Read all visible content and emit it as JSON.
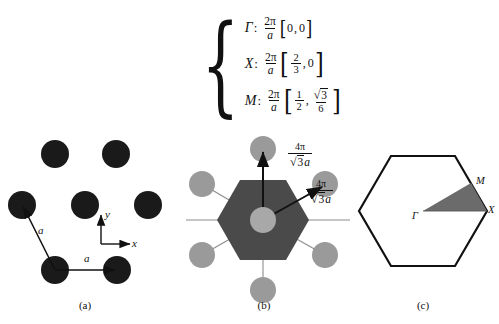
{
  "figure": {
    "background_color": "#ffffff"
  },
  "symmetry_points": {
    "brace_glyph": "{",
    "rows": [
      {
        "symbol": "Γ",
        "colon": ":",
        "prefactor_num": "2π",
        "prefactor_den": "a",
        "open": "[",
        "x": "0",
        "comma": ",",
        "y": "0",
        "close": "]"
      },
      {
        "symbol": "X",
        "colon": ":",
        "prefactor_num": "2π",
        "prefactor_den": "a",
        "open": "[",
        "x_num": "2",
        "x_den": "3",
        "comma": ",",
        "y": "0",
        "close": "]"
      },
      {
        "symbol": "M",
        "colon": ":",
        "prefactor_num": "2π",
        "prefactor_den": "a",
        "open": "[",
        "x_num": "1",
        "x_den": "2",
        "comma": ",",
        "y_num_radical": "√",
        "y_num_radicand": "3",
        "y_den": "6",
        "close": "]"
      }
    ]
  },
  "panel_a": {
    "caption": "(a)",
    "atom_color": "#1a1a1a",
    "lattice_vector_label_1": "a",
    "lattice_vector_label_2": "a",
    "axis_x_label": "x",
    "axis_y_label": "y",
    "atoms": [
      {
        "cx": 55,
        "cy": 22,
        "r": 14
      },
      {
        "cx": 116,
        "cy": 22,
        "r": 14
      },
      {
        "cx": 22,
        "cy": 73,
        "r": 14
      },
      {
        "cx": 85,
        "cy": 73,
        "r": 14
      },
      {
        "cx": 148,
        "cy": 73,
        "r": 14
      },
      {
        "cx": 55,
        "cy": 138,
        "r": 14
      },
      {
        "cx": 117,
        "cy": 138,
        "r": 14
      }
    ]
  },
  "panel_b": {
    "caption": "(b)",
    "zone_fill_color": "#4a4a4a",
    "node_fill_color": "#9a9a9a",
    "center_node_color": "#a8a8a8",
    "label_top_num": "4π",
    "label_top_den_radical": "√",
    "label_top_den_radicand": "3",
    "label_top_den_var": "a",
    "label_right_num": "4π",
    "label_right_den_radical": "√",
    "label_right_den_radicand": "3",
    "label_right_den_var": "a",
    "reciprocal_nodes": [
      {
        "cx": 83,
        "cy": 17,
        "r": 13
      },
      {
        "cx": 22,
        "cy": 52,
        "r": 13
      },
      {
        "cx": 145,
        "cy": 52,
        "r": 13
      },
      {
        "cx": 22,
        "cy": 123,
        "r": 13
      },
      {
        "cx": 145,
        "cy": 123,
        "r": 13
      },
      {
        "cx": 83,
        "cy": 158,
        "r": 13
      }
    ]
  },
  "panel_c": {
    "caption": "(c)",
    "outline_color": "#111111",
    "wedge_fill_color": "#6b6b6b",
    "label_gamma": "Γ",
    "label_m": "M",
    "label_x": "X"
  }
}
